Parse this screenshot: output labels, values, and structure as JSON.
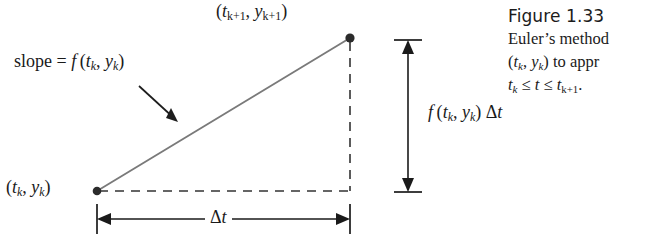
{
  "figure": {
    "caption_title": "Figure 1.33",
    "caption_lines": [
      "Euler’s method",
      "to appr",
      "."
    ],
    "caption_line_prefix_math": {
      "line2": "(t_k, y_k)",
      "line3": "t_k ≤ t ≤ t_{k+1}"
    },
    "colors": {
      "ink": "#1b1b1b",
      "slope_line": "#6e6e6e",
      "dash": "#3a3a3a",
      "dimension": "#1a1a1a",
      "background": "#ffffff"
    }
  },
  "diagram": {
    "labels": {
      "point_next": "(t_{k+1}, y_{k+1})",
      "point_current": "(t_k, y_k)",
      "slope": "slope = f(t_k, y_k)",
      "rise": "f(t_k, y_k) Δt",
      "run": "Δt"
    },
    "label_parts": {
      "slope_prefix": "slope",
      "slope_equals": "=",
      "slope_function": "f",
      "f_symbol": "f",
      "t_symbol": "t",
      "y_symbol": "y",
      "k_sub": "k",
      "k_plus_1_sub": "k+1",
      "delta_t": "Δt",
      "delta_symbol": "Δ",
      "comma": ",",
      "open_paren": "(",
      "close_paren": ")"
    },
    "geometry": {
      "point_current_px": [
        97,
        191
      ],
      "point_next_px": [
        350,
        38
      ],
      "run_arrow_y_px": 219,
      "rise_arrow_x_px": 408,
      "rise_arrow_top_px": 40,
      "rise_arrow_bottom_px": 192
    },
    "marker_names": [
      "start-point-dot",
      "end-point-dot"
    ]
  }
}
